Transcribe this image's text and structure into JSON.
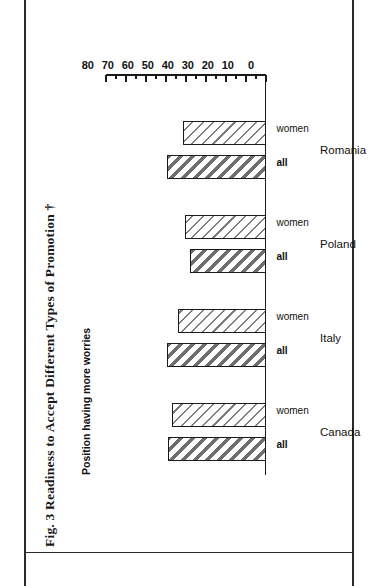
{
  "figure": {
    "caption": "Fig. 3 Readiness to Accept Different Types of Promotion †",
    "subtitle": "Position having more worries"
  },
  "axis": {
    "major_ticks": [
      "0",
      "10",
      "20",
      "30",
      "40",
      "50",
      "60",
      "70",
      "80"
    ],
    "minor_ticks": [
      "5",
      "15",
      "25",
      "35",
      "45",
      "55",
      "65",
      "75"
    ]
  },
  "series_labels": {
    "all": "all",
    "women": "women"
  },
  "groups": [
    {
      "label": "Canada"
    },
    {
      "label": "Italy"
    },
    {
      "label": "Poland"
    },
    {
      "label": "Romania"
    }
  ],
  "chart_data": {
    "type": "bar",
    "title": "Fig. 3 Readiness to Accept Different Types of Promotion †",
    "subtitle": "Position having more worries",
    "orientation": "vertical",
    "rotated_on_page": true,
    "page_rotation_degrees": -90,
    "categories": [
      "Canada",
      "Italy",
      "Poland",
      "Romania"
    ],
    "series": [
      {
        "name": "all",
        "values": [
          49,
          49.5,
          38,
          49.5
        ],
        "pattern": "thick-diagonal-hatch"
      },
      {
        "name": "women",
        "values": [
          47,
          44,
          40.5,
          41.5
        ],
        "pattern": "thin-diagonal-hatch"
      }
    ],
    "xlabel": "",
    "ylabel": "Position having more worries",
    "ylim": [
      0,
      80
    ],
    "ytick_step": 10,
    "yminor_step": 5,
    "grid": false,
    "legend": "none",
    "value_axis_side": "right"
  },
  "colors": {
    "ink": "#1a1a1a",
    "hatch_thick": "#6e6e6e",
    "hatch_thin": "#7d7d7d",
    "background": "#ffffff"
  }
}
